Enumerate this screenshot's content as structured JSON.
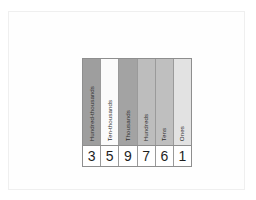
{
  "page": {
    "background_color": "#ffffff",
    "border_color": "#efefef"
  },
  "chart": {
    "border_color": "#8e8e8e",
    "gridline_color": "#9a9a9a",
    "columns": [
      {
        "place_label": "Hundred-thousands",
        "digit": "3",
        "header_fill": "#9e9e9e",
        "digit_fill": "#ffffff"
      },
      {
        "place_label": "Ten-thousands",
        "digit": "5",
        "header_fill": "#fbfbfb",
        "digit_fill": "#ffffff"
      },
      {
        "place_label": "Thousands",
        "digit": "9",
        "header_fill": "#a3a3a3",
        "digit_fill": "#ffffff"
      },
      {
        "place_label": "Hundreds",
        "digit": "7",
        "header_fill": "#bdbdbd",
        "digit_fill": "#ffffff"
      },
      {
        "place_label": "Tens",
        "digit": "6",
        "header_fill": "#bfbfbf",
        "digit_fill": "#ffffff"
      },
      {
        "place_label": "Ones",
        "digit": "1",
        "header_fill": "#e2e2e2",
        "digit_fill": "#ffffff"
      }
    ],
    "number_value": "359761"
  }
}
